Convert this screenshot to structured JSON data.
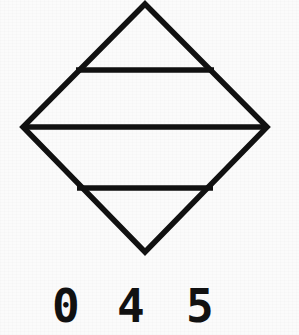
{
  "figure": {
    "name": "diamond-with-three-horizontal-chords",
    "background_color": "#fbfbfb",
    "ink_color": "#111111",
    "stroke_width": 5.5,
    "canvas": {
      "width": 299,
      "height": 335
    },
    "diamond": {
      "shape": "rhombus",
      "vertices": {
        "top": {
          "x": 145,
          "y": 4
        },
        "left": {
          "x": 23,
          "y": 127
        },
        "right": {
          "x": 267,
          "y": 127
        },
        "bottom": {
          "x": 145,
          "y": 252
        }
      },
      "width": 244,
      "height": 248
    },
    "chords": [
      {
        "id": "chord-upper",
        "y": 70,
        "x1": 76,
        "x2": 214,
        "length": 138,
        "label": "upper horizontal line"
      },
      {
        "id": "chord-middle",
        "y": 127,
        "x1": 23,
        "x2": 267,
        "length": 244,
        "label": "middle horizontal line (full diagonal)"
      },
      {
        "id": "chord-lower",
        "y": 188,
        "x1": 77,
        "x2": 213,
        "length": 136,
        "label": "lower horizontal line"
      }
    ],
    "bands": [
      {
        "id": "band-1",
        "label": "top triangle band"
      },
      {
        "id": "band-2",
        "label": "upper trapezoid band"
      },
      {
        "id": "band-3",
        "label": "lower trapezoid band"
      },
      {
        "id": "band-4",
        "label": "bottom triangle band"
      }
    ]
  },
  "labels": {
    "digits": [
      {
        "id": "digit-0",
        "text": "0",
        "x": 52,
        "y": 283
      },
      {
        "id": "digit-4",
        "text": "4",
        "x": 117,
        "y": 283
      },
      {
        "id": "digit-5",
        "text": "5",
        "x": 186,
        "y": 283
      }
    ],
    "combined": "0 4 5"
  }
}
